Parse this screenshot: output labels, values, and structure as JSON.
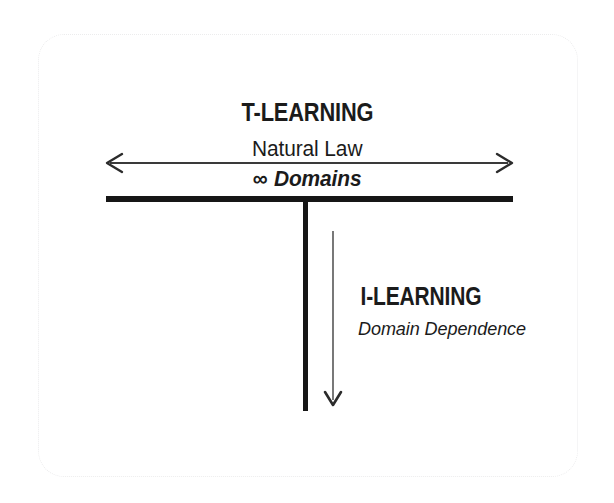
{
  "diagram": {
    "title_top": "T-LEARNING",
    "subtitle_top": "Natural Law",
    "scope_symbol": "∞",
    "scope_text": "Domains",
    "title_bottom": "I-LEARNING",
    "subtitle_bottom": "Domain Dependence",
    "stroke_color": "#161616",
    "arrow_color": "#3a3a3a",
    "frame_color": "#ececed",
    "background_color": "#ffffff",
    "shape": {
      "type": "T-shape",
      "horizontal_bar": {
        "x1": 106,
        "x2": 513,
        "y": 199,
        "thickness": 6
      },
      "vertical_stem": {
        "x": 305,
        "y1": 199,
        "y2": 411,
        "thickness": 5
      }
    },
    "arrows": [
      {
        "name": "horizontal-breadth-arrow",
        "orientation": "horizontal",
        "heads": "double",
        "x1": 106,
        "x2": 512,
        "y": 163,
        "meaning": "T-LEARNING breadth across infinite domains"
      },
      {
        "name": "vertical-depth-arrow",
        "orientation": "vertical",
        "heads": "single-down",
        "x": 333,
        "y1": 231,
        "y2": 406,
        "meaning": "I-LEARNING depth within a dependent domain"
      }
    ]
  }
}
